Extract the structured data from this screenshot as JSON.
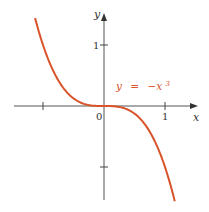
{
  "chart_data": {
    "type": "line",
    "title": "",
    "xlabel": "x",
    "ylabel": "y",
    "function": "y = -x^3",
    "annotation": {
      "text_y": "y",
      "text_eq": "=",
      "text_rhs": "−x",
      "text_exp": "3"
    },
    "series": [
      {
        "name": "y = -x^3",
        "color": "#d9542b",
        "x": [
          -1.13,
          -1.0,
          -0.8,
          -0.6,
          -0.4,
          -0.2,
          0.0,
          0.2,
          0.4,
          0.6,
          0.8,
          1.0,
          1.16
        ],
        "y": [
          1.44,
          1.0,
          0.512,
          0.216,
          0.064,
          0.008,
          0.0,
          -0.008,
          -0.064,
          -0.216,
          -0.512,
          -1.0,
          -1.56
        ]
      }
    ],
    "xticks": [
      -1,
      0,
      1
    ],
    "xtick_labels": [
      "",
      "0",
      "1"
    ],
    "yticks": [
      1,
      -1
    ],
    "ytick_labels": [
      "1",
      ""
    ],
    "xlim": [
      -1.7,
      1.6
    ],
    "ylim": [
      -1.7,
      1.7
    ],
    "grid": false,
    "legend": "none"
  },
  "colors": {
    "curve": "#d9542b",
    "axis": "#555555",
    "label": "#d9542b"
  }
}
